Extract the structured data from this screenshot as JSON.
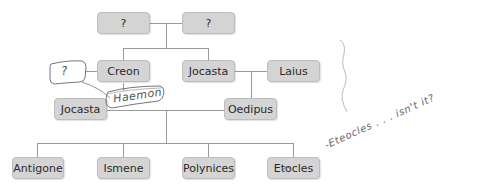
{
  "diagram": {
    "type": "family-tree",
    "nodes": {
      "grandparent_1": "?",
      "grandparent_2": "?",
      "creon": "Creon",
      "jocasta_top": "Jocasta",
      "laius": "Laius",
      "jocasta_mid": "Jocasta",
      "oedipus": "Oedipus",
      "antigone": "Antigone",
      "ismene": "Ismene",
      "polynices": "Polynices",
      "etocles": "Etocles"
    },
    "annotations": {
      "creon_spouse": "?",
      "creon_child": "Haemon",
      "etocles_note": "-Eteocles . . . isn't it?"
    },
    "colors": {
      "box_fill": "#d4d4d4",
      "box_border": "#bdbdbd",
      "connector": "#9a9a9a",
      "handwriting": "#555555"
    }
  }
}
